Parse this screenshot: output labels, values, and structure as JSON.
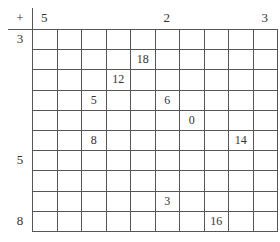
{
  "operator": "+",
  "column_headers": [
    "5",
    "",
    "",
    "",
    "",
    "2",
    "",
    "",
    "",
    "3"
  ],
  "row_headers": [
    "3",
    "",
    "",
    "",
    "",
    "",
    "5",
    "",
    "",
    "8"
  ],
  "cells": [
    [
      "",
      "",
      "",
      "",
      "",
      "",
      "",
      "",
      "",
      ""
    ],
    [
      "",
      "",
      "",
      "",
      "18",
      "",
      "",
      "",
      "",
      ""
    ],
    [
      "",
      "",
      "",
      "12",
      "",
      "",
      "",
      "",
      "",
      ""
    ],
    [
      "",
      "",
      "5",
      "",
      "",
      "6",
      "",
      "",
      "",
      ""
    ],
    [
      "",
      "",
      "",
      "",
      "",
      "",
      "0",
      "",
      "",
      ""
    ],
    [
      "",
      "",
      "8",
      "",
      "",
      "",
      "",
      "",
      "14",
      ""
    ],
    [
      "",
      "",
      "",
      "",
      "",
      "",
      "",
      "",
      "",
      ""
    ],
    [
      "",
      "",
      "",
      "",
      "",
      "",
      "",
      "",
      "",
      ""
    ],
    [
      "",
      "",
      "",
      "",
      "",
      "3",
      "",
      "",
      "",
      ""
    ],
    [
      "",
      "",
      "",
      "",
      "",
      "",
      "",
      "16",
      "",
      ""
    ]
  ]
}
